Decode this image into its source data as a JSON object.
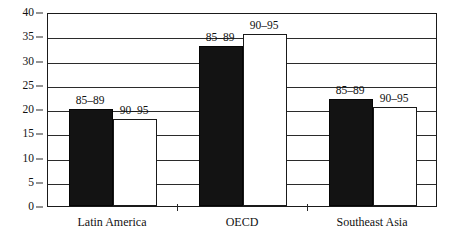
{
  "chart_data": {
    "type": "bar",
    "title": "",
    "subtitle": "",
    "xlabel": "",
    "ylabel": "",
    "categories": [
      "Latin America",
      "OECD",
      "Southeast Asia"
    ],
    "series": [
      {
        "name": "85–89",
        "values": [
          20,
          33,
          22
        ]
      },
      {
        "name": "90–95",
        "values": [
          18,
          35.5,
          20.5
        ]
      }
    ],
    "ylim": [
      0,
      40
    ],
    "ytick_step": 5,
    "yticks": [
      "0",
      "5",
      "10",
      "15",
      "20",
      "25",
      "30",
      "35",
      "40"
    ],
    "grid": true,
    "legend": "inline-labels-above-bars",
    "series_colors": [
      "#131313",
      "#ffffff"
    ],
    "annotations": [
      {
        "text": "85–89",
        "group": "Latin America",
        "series": "85–89"
      },
      {
        "text": "90–95",
        "group": "Latin America",
        "series": "90–95"
      },
      {
        "text": "85–89",
        "group": "OECD",
        "series": "85–89"
      },
      {
        "text": "90–95",
        "group": "OECD",
        "series": "90–95"
      },
      {
        "text": "85–89",
        "group": "Southeast Asia",
        "series": "85–89"
      },
      {
        "text": "90–95",
        "group": "Southeast Asia",
        "series": "90–95"
      }
    ]
  },
  "axis": {
    "y_ticks": [
      "40",
      "35",
      "30",
      "25",
      "20",
      "15",
      "10",
      "5",
      "0"
    ],
    "x_labels": [
      "Latin America",
      "OECD",
      "Southeast Asia"
    ]
  }
}
